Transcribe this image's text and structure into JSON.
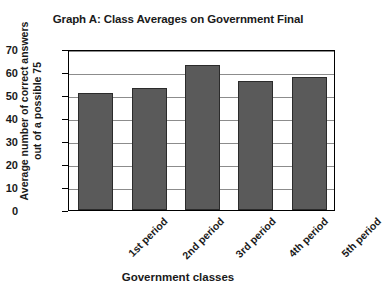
{
  "chart_data": {
    "type": "bar",
    "title": "Graph A: Class Averages on Government Final",
    "xlabel": "Government classes",
    "ylabel": "Average number of correct answers out of a possible 75",
    "ylabel_lines": [
      "Average number of correct answers",
      "out of a possible 75"
    ],
    "categories": [
      "1st period",
      "2nd period",
      "3rd period",
      "4th period",
      "5th period"
    ],
    "values": [
      51,
      53,
      63,
      56,
      58
    ],
    "ylim": [
      0,
      70
    ],
    "ytick_step": 10,
    "yticks": [
      70,
      60,
      50,
      40,
      30,
      20,
      10,
      0
    ],
    "grid": true,
    "legend": "none",
    "bar_color": "#5a5a5a",
    "bar_outline_color": "#2b2b2b",
    "gridline_color": "#8c8c8c",
    "axis_color": "#000000",
    "background": "#ffffff"
  }
}
